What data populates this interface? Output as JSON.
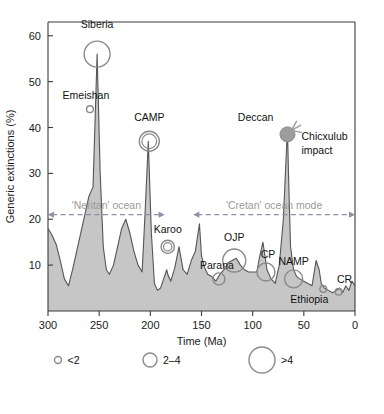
{
  "chart_data": {
    "type": "area",
    "title": "",
    "xlabel": "Time (Ma)",
    "ylabel": "Generic extinctions (%)",
    "xlim": [
      300,
      0
    ],
    "ylim": [
      0,
      63
    ],
    "x_ticks": [
      300,
      250,
      200,
      150,
      100,
      50,
      0
    ],
    "y_ticks": [
      10,
      20,
      30,
      40,
      50,
      60
    ],
    "grid": false,
    "axis_direction": "x reversed (old to young)",
    "series": [
      {
        "name": "Generic extinctions",
        "x": [
          300,
          296,
          292,
          288,
          284,
          280,
          276,
          272,
          268,
          264,
          260,
          256,
          252,
          249,
          246,
          243,
          240,
          236,
          232,
          228,
          224,
          220,
          216,
          212,
          208,
          205,
          202,
          199,
          196,
          193,
          190,
          187,
          184,
          183,
          180,
          176,
          172,
          168,
          164,
          160,
          156,
          152,
          150,
          147,
          144,
          140,
          136,
          132,
          128,
          124,
          120,
          116,
          112,
          108,
          104,
          100,
          96,
          93,
          90,
          86,
          82,
          78,
          74,
          70,
          66,
          65,
          63,
          60,
          57,
          54,
          50,
          46,
          42,
          38,
          35,
          33,
          30,
          26,
          22,
          18,
          15,
          12,
          9,
          6,
          3,
          0
        ],
        "y": [
          18,
          16.5,
          14.5,
          11,
          7,
          5.5,
          9,
          13,
          17,
          21,
          25,
          27,
          56,
          30,
          14,
          9,
          8,
          10,
          14,
          18,
          20,
          17,
          13,
          10,
          8.5,
          22,
          37,
          17,
          6,
          4.5,
          5,
          7,
          9,
          8,
          6.5,
          9.5,
          14,
          9,
          8,
          11,
          13,
          19,
          12,
          9.5,
          8,
          7.5,
          6.5,
          8,
          9,
          10.5,
          11,
          11.5,
          10,
          9,
          8.5,
          8.5,
          8.5,
          12,
          15,
          9,
          7,
          6,
          10,
          20,
          40,
          30,
          14,
          9,
          7.5,
          7,
          6.5,
          6,
          5.5,
          11,
          9,
          6,
          5,
          4.5,
          4,
          4.5,
          5,
          4,
          5.5,
          4.5,
          6.5,
          5.5
        ]
      }
    ],
    "events": [
      {
        "name": "Siberia",
        "label": "Siberia",
        "x": 252,
        "y": 56,
        "size": ">4",
        "marker": "circle-large",
        "label_dx": 0,
        "label_dy": -26,
        "anchor": "middle"
      },
      {
        "name": "Emeishan",
        "label": "Emeishan",
        "x": 259,
        "y": 44,
        "size": "<2",
        "marker": "circle-small",
        "label_dx": -4,
        "label_dy": -10,
        "anchor": "middle"
      },
      {
        "name": "CAMP",
        "label": "CAMP",
        "x": 201,
        "y": 37,
        "size": "2-4",
        "marker": "circle-double",
        "label_dx": 0,
        "label_dy": -20,
        "anchor": "middle"
      },
      {
        "name": "Deccan",
        "label": "Deccan",
        "x": 66,
        "y": 38.5,
        "size": ">4",
        "marker": "circle-filled-impact",
        "label_dx": -14,
        "label_dy": -13,
        "anchor": "end"
      },
      {
        "name": "Chicxulub impact",
        "label": "Chicxulub",
        "label2": "impact",
        "x": 66,
        "y": 38.5,
        "size": "impact",
        "marker": "impact-rays",
        "label_dx": 14,
        "label_dy": 6,
        "anchor": "start"
      },
      {
        "name": "Karoo",
        "label": "Karoo",
        "x": 183,
        "y": 14,
        "size": "2-4",
        "marker": "circle-double-small",
        "label_dx": 0,
        "label_dy": -14,
        "anchor": "middle"
      },
      {
        "name": "Parana",
        "label": "Parana",
        "x": 133,
        "y": 7,
        "size": "<2",
        "marker": "circle-small-med",
        "label_dx": -2,
        "label_dy": -10,
        "anchor": "middle"
      },
      {
        "name": "OJP",
        "label": "OJP",
        "x": 118,
        "y": 11,
        "size": ">4",
        "marker": "circle-large-med",
        "label_dx": 0,
        "label_dy": -20,
        "anchor": "middle"
      },
      {
        "name": "CP",
        "label": "CP",
        "x": 87,
        "y": 8.5,
        "size": "2-4",
        "marker": "circle-med",
        "label_dx": 2,
        "label_dy": -14,
        "anchor": "middle"
      },
      {
        "name": "NAMP",
        "label": "NAMP",
        "x": 60,
        "y": 7,
        "size": "2-4",
        "marker": "circle-med",
        "label_dx": 0,
        "label_dy": -14,
        "anchor": "middle"
      },
      {
        "name": "Ethiopia",
        "label": "Ethiopia",
        "x": 31,
        "y": 4.8,
        "size": "<2",
        "marker": "circle-small",
        "label_dx": -14,
        "label_dy": 14,
        "anchor": "middle"
      },
      {
        "name": "CR",
        "label": "CR",
        "x": 16,
        "y": 4.2,
        "size": "<2",
        "marker": "circle-small",
        "label_dx": 6,
        "label_dy": -9,
        "anchor": "middle"
      }
    ],
    "annotations": [
      {
        "name": "neritan-ocean",
        "text": "'Neritan' ocean",
        "x_start": 300,
        "x_end": 186,
        "y": 21,
        "style": "dashed-double-arrow"
      },
      {
        "name": "cretan-ocean",
        "text": "'Cretan' ocean mode",
        "x_start": 158,
        "x_end": 0,
        "y": 21,
        "style": "dashed-double-arrow"
      }
    ],
    "legend": {
      "position": "below-axis",
      "title": "",
      "entries": [
        {
          "label": "<2",
          "radius": 3.5
        },
        {
          "label": "2–4",
          "radius": 7
        },
        {
          "label": ">4",
          "radius": 13
        }
      ]
    },
    "colors": {
      "area_fill": "#c6c6c6",
      "curve_line": "#555555",
      "axis": "#3b3b3b",
      "marker": "#8a8a8a",
      "marker_filled": "#9c9c9c",
      "mode_annotation": "#9a9a9a",
      "mode_arrow": "#8e8ea8",
      "text": "#111111"
    }
  }
}
